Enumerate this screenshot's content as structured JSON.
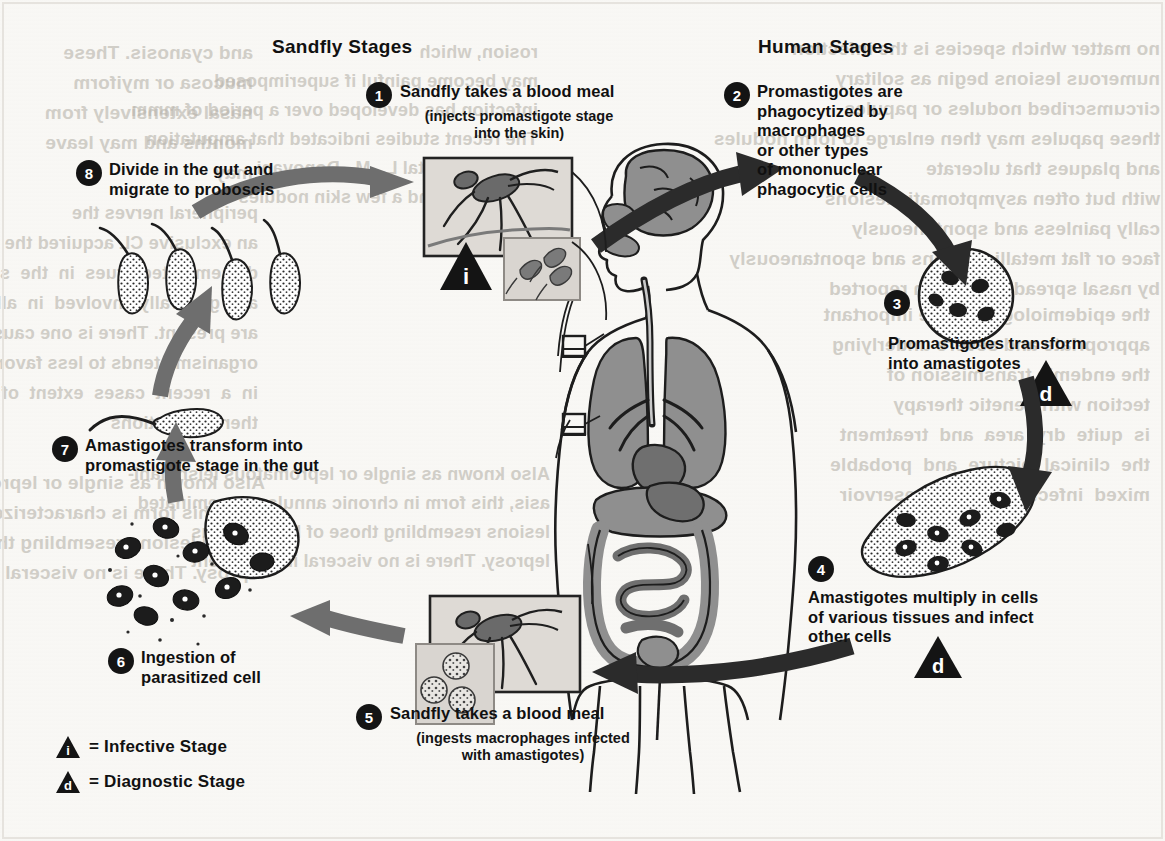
{
  "figure": {
    "title_left": "Sandfly Stages",
    "title_right": "Human Stages"
  },
  "steps": [
    {
      "number": "1",
      "text": "Sandfly takes a blood meal",
      "subtext": "(injects promastigote stage\ninto the skin)"
    },
    {
      "number": "2",
      "text": "Promastigotes are\nphagocytized by\nmacrophages\nor other types\nof mononuclear\nphagocytic cells",
      "subtext": ""
    },
    {
      "number": "3",
      "text": "Promastigotes transform\ninto amastigotes",
      "subtext": ""
    },
    {
      "number": "4",
      "text": "Amastigotes multiply in cells\nof various tissues and infect\nother cells",
      "subtext": ""
    },
    {
      "number": "5",
      "text": "Sandfly takes a blood meal",
      "subtext": "(ingests macrophages infected\nwith amastigotes)"
    },
    {
      "number": "6",
      "text": "Ingestion of\nparasitized cell",
      "subtext": ""
    },
    {
      "number": "7",
      "text": "Amastigotes transform into\npromastigote stage in  the gut",
      "subtext": ""
    },
    {
      "number": "8",
      "text": "Divide in the gut and\nmigrate to proboscis",
      "subtext": ""
    }
  ],
  "legend": [
    {
      "icon": "infective-stage-triangle-icon",
      "marker": "i",
      "label": "= Infective Stage"
    },
    {
      "icon": "diagnostic-stage-triangle-icon",
      "marker": "d",
      "label": "= Diagnostic Stage"
    }
  ],
  "stage_markers": [
    {
      "marker": "i",
      "near_step": "1"
    },
    {
      "marker": "d",
      "near_step": "3"
    },
    {
      "marker": "d",
      "near_step": "4"
    }
  ],
  "colors": {
    "ink": "#141414",
    "arrow_dark": "#2b2b2b",
    "arrow_grey": "#6e6e6e",
    "organ_fill": "#8f8f8f",
    "paper": "#f7f6f3",
    "showthrough": "#b9b5ad"
  },
  "background_showthrough": {
    "note": "faint mirrored text bleeding through from the reverse side of the scanned page",
    "column_left": "and cyanosis. These\nmucosa or myiform\nnasal extensively from\nmonths and may leave\nmay",
    "column_mid": "rosion, which\nmay become painful if superimposed\ninfection has developed over a period of months",
    "column_right": "no matter which species is the infection\nnumerous lesions begin as solitary\ncircumscribed nodules or papules\nthese papules may then enlarge to form nodules\nand plaques that ulcerate\nwith but often asymptomatic lesions\ncally painless and spontaneously\nface or flat metallic lesions and spontaneously\nby nasal spread have been reported"
  }
}
